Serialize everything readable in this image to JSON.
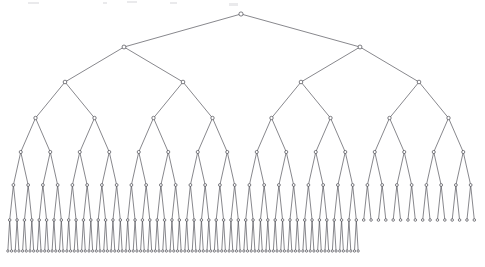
{
  "figure": {
    "kind": "binary-tree-diagram",
    "title": "",
    "caption": "",
    "background_color": "#ffffff",
    "edge_color": "#55555c",
    "node_stroke_color": "#3c3c44",
    "node_fill_color": "#ffffff",
    "edge_width": 0.7,
    "node_radius_top": 2.1,
    "node_radius_bottom": 1.15,
    "canvas": {
      "width": 485,
      "height": 267
    }
  },
  "chart_data": {
    "type": "diagram",
    "subtype": "binary-tree",
    "title": "",
    "xlabel": "",
    "ylabel": "",
    "orientation": "top-down",
    "root": {
      "x": 241,
      "y": 14
    },
    "depth_levels": 8,
    "total_nodes": 223,
    "leaf_count": 112,
    "levels": [
      {
        "level": 1,
        "y": 14,
        "node_count": 1,
        "x_start": 241,
        "x_end": 241,
        "spacing": 0,
        "full": true,
        "children_present": true
      },
      {
        "level": 2,
        "y": 47,
        "node_count": 2,
        "x_start": 124,
        "x_end": 360,
        "spacing": 236,
        "full": true,
        "children_present": true
      },
      {
        "level": 3,
        "y": 82,
        "node_count": 4,
        "x_start": 65,
        "x_end": 419,
        "spacing": 118,
        "full": true,
        "children_present": true
      },
      {
        "level": 4,
        "y": 118,
        "node_count": 8,
        "x_start": 35.5,
        "x_end": 448.5,
        "spacing": 59,
        "full": true,
        "children_present": true
      },
      {
        "level": 5,
        "y": 152,
        "node_count": 16,
        "x_start": 20.75,
        "x_end": 463.25,
        "spacing": 29.5,
        "full": true,
        "children_present": true
      },
      {
        "level": 6,
        "y": 185,
        "node_count": 32,
        "x_start": 13.4,
        "x_end": 470.6,
        "spacing": 14.75,
        "full": true,
        "children_present": true
      },
      {
        "level": 7,
        "y": 220,
        "node_count": 64,
        "x_start": 9.7,
        "x_end": 474.3,
        "spacing": 7.375,
        "full": true,
        "children_present": false
      },
      {
        "level": 8,
        "y": 251,
        "node_count": 96,
        "x_start": 7.85,
        "x_end": 372.5,
        "spacing": 3.6875,
        "full": false,
        "children_present": false
      }
    ],
    "level8_note": "Level 8 exists only under the first 48 of the 64 level-7 nodes (left of approximately x = 372); the remaining 16 level-7 nodes on the right are leaves.",
    "level8_parent_first_index": 0,
    "level8_parent_last_index": 47,
    "level7_leaf_first_index": 48,
    "level7_leaf_last_index": 63,
    "axis_visible": false,
    "grid": false,
    "legend": null,
    "annotations": []
  },
  "scan_artifacts": [
    {
      "x": 28,
      "y": 2,
      "width": 11,
      "height": 2
    },
    {
      "x": 103,
      "y": 2,
      "width": 4,
      "height": 2
    },
    {
      "x": 127,
      "y": 1,
      "width": 10,
      "height": 2
    },
    {
      "x": 170,
      "y": 2,
      "width": 7,
      "height": 2
    },
    {
      "x": 229,
      "y": 3,
      "width": 9,
      "height": 3
    }
  ]
}
